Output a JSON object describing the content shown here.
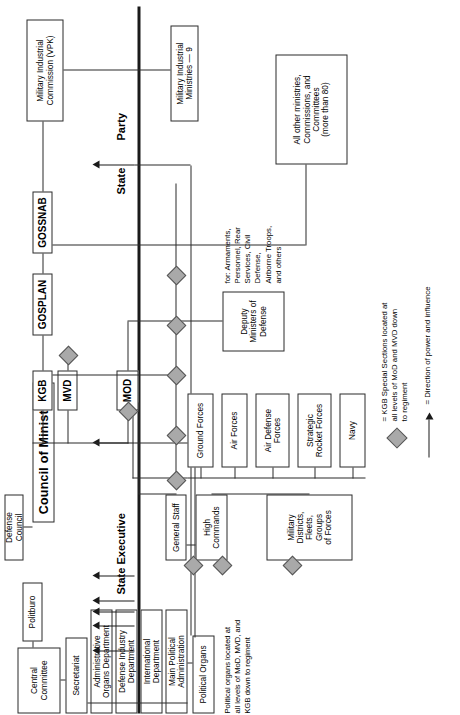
{
  "section_labels": {
    "party_top": "Party",
    "state_executive": "State Executive",
    "state_bottom": "State",
    "party_bottom": "Party"
  },
  "state_nodes": {
    "vpk": "Military Industrial\nCommission (VPK)",
    "mi_ministries": "Military Industrial\nMinistries — 9",
    "all_other": "All other ministries,\nCommissions, and\nCommittees\n(more than 80)",
    "council_of_ministers": "Council of Ministers",
    "defense_council": "Defense Council",
    "gossnab": "GOSSNAB",
    "gosplan": "GOSPLAN",
    "kgb": "KGB",
    "mvd": "MVD",
    "mod": "MOD",
    "deputy_ministers": "Deputy\nMinisters of\nDefense",
    "deputy_note": "for: Armaments,\nPersonnel, Rear\nServices, Civil\nDefense,\nAirborne Troops,\nand others",
    "general_staff": "General Staff",
    "high_commands": "High\nCommands",
    "military_districts": "Military\nDistricts,\nFleets,\nGroups\nof Forces"
  },
  "services": [
    "Ground Forces",
    "Air Forces",
    "Air Defense\nForces",
    "Strategic\nRocket Forces",
    "Navy"
  ],
  "party_nodes": {
    "central_committee": "Central\nCommittee",
    "politburo": "Politburo",
    "secretariat": "Secretariat",
    "admin_organs": "Administrative\nOrgans Department",
    "defense_industry": "Defense Industry\nDepartment",
    "international": "International\nDepartment",
    "main_political": "Main Political\nAdministration",
    "political_organs": "Political Organs",
    "political_organs_note": "Political organs located at\nall levels of MoD, MVD, and\nKGB down to regiment"
  },
  "legend": {
    "diamond_text": "= KGB Special Sections located at\nall levels of MoD and MVD down\nto regiment",
    "arrow_text": "= Direction of power and influence"
  },
  "colors": {
    "diamond_fill": "#a9a9a9",
    "line": "#2b2b2b",
    "background": "#ffffff"
  }
}
